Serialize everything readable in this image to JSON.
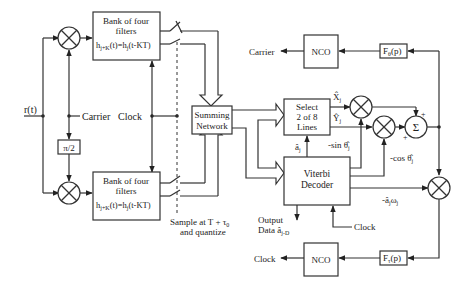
{
  "diagram": {
    "input_signal": "r(t)",
    "filter_bank_top": {
      "line1": "Bank of four",
      "line2": "filters",
      "line3": "h",
      "sub1": "j+K",
      "line3b": "(t)=h",
      "sub2": "j",
      "line3c": "(t-KT)"
    },
    "filter_bank_bottom": {
      "line1": "Bank of four",
      "line2": "filters",
      "line3": "h",
      "sub1": "j+K",
      "line3b": "(t)=h",
      "sub2": "j",
      "line3c": "(t-KT)"
    },
    "phase_shift": "π/2",
    "carrier_label": "Carrier",
    "clock_label": "Clock",
    "summing_network": {
      "line1": "Summing",
      "line2": "Network"
    },
    "sample_label": {
      "line1": "Sample at T + τ",
      "sub": "0",
      "line2": "and quantize"
    },
    "select_block": {
      "line1": "Select",
      "line2": "2 of 8",
      "line3": "Lines"
    },
    "viterbi_block": {
      "line1": "Viterbi",
      "line2": "Decoder"
    },
    "output_label": {
      "line1": "Output",
      "line2": "Data â",
      "sub": "j-D"
    },
    "a_hat_label": "â",
    "a_hat_sub": "j",
    "x_hat": "X̂",
    "x_sub": "j",
    "y_hat": "Ŷ",
    "y_sub": "j",
    "sin_label": "-sin θ̂",
    "sin_sub": "j",
    "cos_label": "-cos θ̂",
    "cos_sub": "j",
    "aw_label": "-â",
    "aw_sub1": "j",
    "aw_mid": "ω",
    "aw_sub2": "j",
    "sigma": "Σ",
    "plus": "+",
    "nco_top": "NCO",
    "nco_bottom": "NCO",
    "carrier_out": "Carrier",
    "clock_out": "Clock",
    "viterbi_clock": "Clock",
    "f_theta": {
      "main": "F",
      "sub": "θ",
      "rest": "(p)"
    },
    "f_tau": {
      "main": "F",
      "sub": "τ",
      "rest": "(p)"
    }
  }
}
